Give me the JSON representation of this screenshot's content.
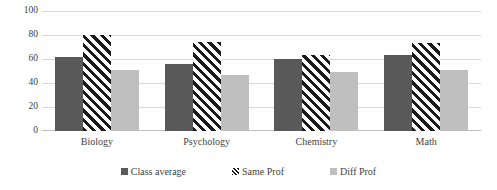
{
  "chart_data": {
    "type": "bar",
    "title": "",
    "xlabel": "",
    "ylabel": "",
    "categories": [
      "Biology",
      "Psychology",
      "Chemistry",
      "Math"
    ],
    "series": [
      {
        "name": "Class average",
        "color": "#595959",
        "pattern": "solid",
        "values": [
          62,
          56,
          60,
          63
        ]
      },
      {
        "name": "Same Prof",
        "color": "#1a1a1a",
        "pattern": "diagonal-stripes",
        "values": [
          80,
          74,
          63,
          73
        ]
      },
      {
        "name": "Diff Prof",
        "color": "#bfbfbf",
        "pattern": "solid",
        "values": [
          51,
          47,
          49,
          51
        ]
      }
    ],
    "ylim": [
      0,
      100
    ],
    "yticks": [
      0,
      20,
      40,
      60,
      80,
      100
    ],
    "ytick_labels": [
      "0",
      "20",
      "40",
      "60",
      "80",
      "100"
    ],
    "grid": true,
    "grid_axis": "y",
    "legend_position": "bottom",
    "legend_entries": [
      "Class average",
      "Same Prof",
      "Diff Prof"
    ]
  },
  "colors": {
    "series_class_average": "#595959",
    "series_same_prof": "#1a1a1a",
    "series_diff_prof": "#bfbfbf",
    "gridline": "#d9d9d9",
    "axis": "#bfbfbf",
    "text": "#3f3f3f",
    "background": "#ffffff"
  }
}
